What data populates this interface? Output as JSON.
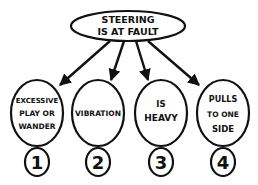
{
  "diagram": {
    "type": "tree",
    "colors": {
      "stroke": "#111111",
      "background": "#ffffff"
    },
    "root": {
      "lines": [
        "STEERING",
        "IS AT FAULT"
      ]
    },
    "children": [
      {
        "number": "1",
        "lines": [
          "EXCESSIVE",
          "PLAY OR",
          "WANDER"
        ]
      },
      {
        "number": "2",
        "lines": [
          "VIBRATION"
        ]
      },
      {
        "number": "3",
        "lines": [
          "IS",
          "HEAVY"
        ]
      },
      {
        "number": "4",
        "lines": [
          "PULLS",
          "TO ONE",
          "SIDE"
        ]
      }
    ]
  }
}
